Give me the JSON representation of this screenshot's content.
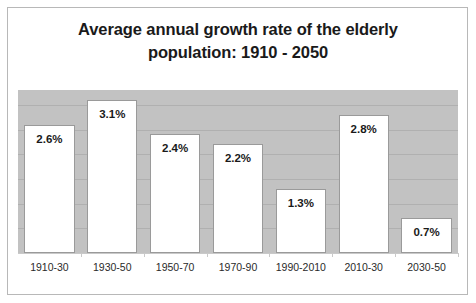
{
  "chart_data": {
    "type": "bar",
    "title": "Average annual growth rate of the elderly population: 1910 - 2050",
    "title_line1": "Average annual growth rate of the elderly",
    "title_line2": "population: 1910 - 2050",
    "xlabel": "",
    "ylabel": "",
    "categories": [
      "1910-30",
      "1930-50",
      "1950-70",
      "1970-90",
      "1990-2010",
      "2010-30",
      "2030-50"
    ],
    "values": [
      2.6,
      3.1,
      2.4,
      2.2,
      1.3,
      2.8,
      0.7
    ],
    "data_labels": [
      "2.6%",
      "3.1%",
      "2.4%",
      "2.2%",
      "1.3%",
      "2.8%",
      "0.7%"
    ],
    "ylim": [
      0,
      3.3
    ],
    "grid": true,
    "gridlines": [
      0.5,
      1.0,
      1.5,
      2.0,
      2.5,
      3.0
    ],
    "legend": "none",
    "colors": {
      "bar_fill": "#ffffff",
      "bar_border": "#9a9a9a",
      "plot_background": "#c2c2c2",
      "gridline": "#b0b0b0",
      "text": "#1a1a1a",
      "frame": "#b8b8b8"
    }
  }
}
